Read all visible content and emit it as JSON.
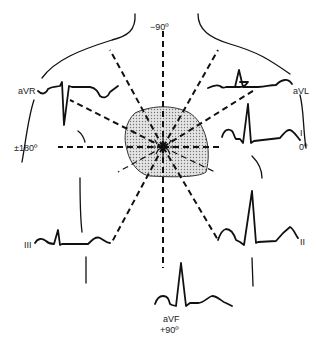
{
  "center": {
    "x": 155,
    "y": 147
  },
  "leads": [
    {
      "name": "aVR",
      "label": "aVR",
      "angle_label": "",
      "angle_deg": -150
    },
    {
      "name": "aVL",
      "label": "aVL",
      "angle_label": "",
      "angle_deg": -30
    },
    {
      "name": "I",
      "label": "I",
      "angle_label": "0º",
      "angle_deg": 0
    },
    {
      "name": "II",
      "label": "II",
      "angle_label": "",
      "angle_deg": 60
    },
    {
      "name": "aVF",
      "label": "aVF",
      "angle_label": "+90º",
      "angle_deg": 90
    },
    {
      "name": "III",
      "label": "III",
      "angle_label": "",
      "angle_deg": 120
    }
  ],
  "axis_labels": {
    "top": "−90º",
    "left": "±180º",
    "right": "0º",
    "bottom": "+90º"
  },
  "colors": {
    "line": "#111111",
    "heart_fill": "#cfcfcf",
    "background": "#ffffff"
  }
}
